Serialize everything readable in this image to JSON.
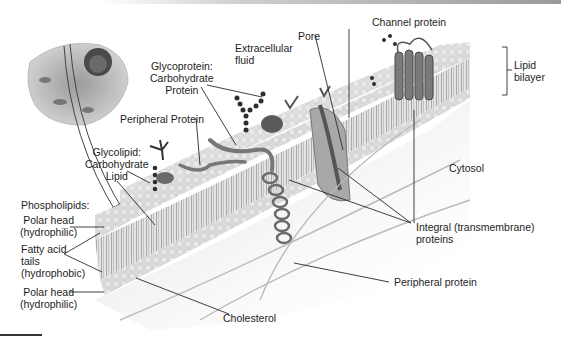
{
  "figure": {
    "colors": {
      "background": "#ffffff",
      "membrane": "#d9d9d9",
      "head": "#cfcfcf",
      "protein": "#6e6e6e",
      "carbohydrate": "#3a3a3a",
      "text": "#1e1e1e",
      "leader": "#2a2a2a"
    }
  },
  "labels": {
    "channel_protein": "Channel protein",
    "pore": "Pore",
    "extracellular_1": "Extracellular",
    "extracellular_2": "fluid",
    "glycoprotein_1": "Glycoprotein:",
    "glycoprotein_2": "Carbohydrate",
    "glycoprotein_3": "Protein",
    "peripheral_protein_top": "Peripheral Protein",
    "glycolipid_1": "Glycolipid:",
    "glycolipid_2": "Carbohydrate",
    "glycolipid_3": "Lipid",
    "lipid_bilayer_1": "Lipid",
    "lipid_bilayer_2": "bilayer",
    "cytosol": "Cytosol",
    "phospholipids": "Phospholipids:",
    "polar_head_top_1": "Polar head",
    "polar_head_top_2": "(hydrophilic)",
    "fatty_acid_1": "Fatty acid",
    "fatty_acid_2": "tails",
    "fatty_acid_3": "(hydrophobic)",
    "polar_head_bottom_1": "Polar head",
    "polar_head_bottom_2": "(hydrophilic)",
    "integral_1": "Integral (transmembrane)",
    "integral_2": "proteins",
    "peripheral_protein_bottom": "Peripheral protein",
    "cholesterol": "Cholesterol"
  }
}
